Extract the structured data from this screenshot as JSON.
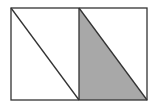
{
  "diagram": {
    "colors": {
      "stroke": "#333333",
      "shade": "#a8a8a8",
      "background": "#ffffff"
    },
    "rectangle": {
      "x": 11,
      "y": 8,
      "width": 136,
      "height": 92
    },
    "divider_x": 79,
    "shaded_triangle": "79,8 147,100 79,100"
  }
}
